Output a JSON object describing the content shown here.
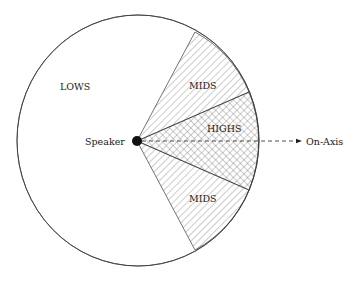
{
  "diagram": {
    "type": "speaker-dispersion-pattern",
    "regions": [
      {
        "id": "lows",
        "label": "LOWS",
        "pattern": "none"
      },
      {
        "id": "mids-upper",
        "label": "MIDS",
        "pattern": "diagonal-hatch"
      },
      {
        "id": "highs",
        "label": "HIGHS",
        "pattern": "cross-hatch"
      },
      {
        "id": "mids-lower",
        "label": "MIDS",
        "pattern": "diagonal-hatch"
      }
    ],
    "source": {
      "label": "Speaker"
    },
    "axis": {
      "label": "On-Axis",
      "style": "dashed-arrow"
    }
  },
  "colors": {
    "stroke": "#3a3a3a",
    "hatch": "#555555",
    "text": "#1a1a1a",
    "background": "#ffffff"
  }
}
